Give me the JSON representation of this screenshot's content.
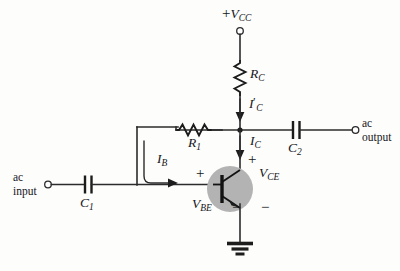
{
  "figure": {
    "kind": "circuit-schematic",
    "background_color": "#fdfdfc",
    "ink_color": "#1c1c1c",
    "transistor_fill": "#b3b3b3"
  },
  "labels": {
    "vcc": {
      "sign": "+",
      "symbol": "V",
      "subscript": "CC",
      "text": "+VCC"
    },
    "rc": {
      "symbol": "R",
      "subscript": "C",
      "text": "RC"
    },
    "ic_prime": {
      "symbol": "I",
      "prime": "′",
      "subscript": "C",
      "text": "I′C"
    },
    "ic": {
      "symbol": "I",
      "subscript": "C",
      "text": "IC"
    },
    "ib": {
      "symbol": "I",
      "subscript": "B",
      "text": "IB"
    },
    "r1": {
      "symbol": "R",
      "subscript": "1",
      "text": "R1"
    },
    "c1": {
      "symbol": "C",
      "subscript": "1",
      "text": "C1"
    },
    "c2": {
      "symbol": "C",
      "subscript": "2",
      "text": "C2"
    },
    "vce": {
      "symbol": "V",
      "subscript": "CE",
      "text": "VCE"
    },
    "vbe": {
      "symbol": "V",
      "subscript": "BE",
      "text": "VBE"
    },
    "ac_input": {
      "line1": "ac",
      "line2": "input"
    },
    "ac_output": {
      "line1": "ac",
      "line2": "output"
    },
    "plus_vbe": "+",
    "minus_vbe": "−",
    "plus_vce": "+",
    "minus_vce": "−"
  },
  "components": [
    {
      "id": "rc",
      "type": "resistor",
      "orientation": "vertical",
      "label": "RC"
    },
    {
      "id": "r1",
      "type": "resistor",
      "orientation": "horizontal",
      "label": "R1"
    },
    {
      "id": "c1",
      "type": "capacitor",
      "orientation": "vertical-plates",
      "label": "C1"
    },
    {
      "id": "c2",
      "type": "capacitor",
      "orientation": "vertical-plates",
      "label": "C2"
    },
    {
      "id": "q1",
      "type": "transistor-npn",
      "label": ""
    },
    {
      "id": "gnd",
      "type": "ground",
      "label": ""
    }
  ],
  "terminals": [
    {
      "id": "vcc-terminal",
      "label": "+VCC"
    },
    {
      "id": "ac-input-terminal",
      "label": "ac input"
    },
    {
      "id": "ac-output-terminal",
      "label": "ac output"
    }
  ],
  "currents": [
    {
      "id": "ic-prime-arrow",
      "label": "I′C",
      "direction": "down"
    },
    {
      "id": "ic-arrow",
      "label": "IC",
      "direction": "down"
    },
    {
      "id": "ib-arrow",
      "label": "IB",
      "direction": "right"
    }
  ]
}
